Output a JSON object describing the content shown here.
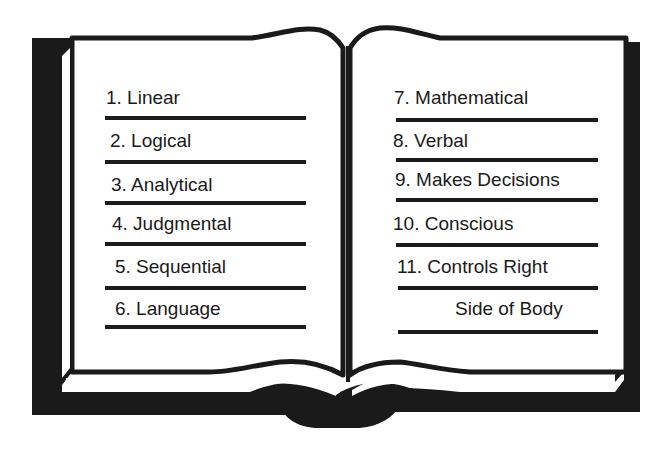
{
  "colors": {
    "ink": "#1a1a1a",
    "paper": "#ffffff"
  },
  "book": {
    "left_page": {
      "items": [
        {
          "label": "1. Linear"
        },
        {
          "label": "2. Logical"
        },
        {
          "label": "3. Analytical"
        },
        {
          "label": "4. Judgmental"
        },
        {
          "label": "5. Sequential"
        },
        {
          "label": "6. Language"
        }
      ]
    },
    "right_page": {
      "items": [
        {
          "label": "7. Mathematical"
        },
        {
          "label": "8. Verbal"
        },
        {
          "label": "9. Makes Decisions"
        },
        {
          "label": "10. Conscious"
        },
        {
          "label": "11. Controls Right"
        },
        {
          "label": "Side of Body"
        }
      ]
    }
  }
}
